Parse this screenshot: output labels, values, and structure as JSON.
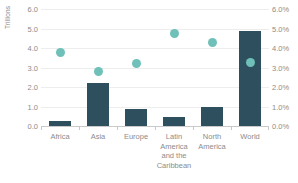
{
  "chart_data": {
    "type": "bar",
    "title": "",
    "subtitle": "",
    "xlabel": "",
    "ylabel": "Trillions",
    "y2label": "",
    "ylim": [
      0,
      6
    ],
    "y2lim": [
      0,
      6
    ],
    "grid": true,
    "legend": "none",
    "categories": [
      "Africa",
      "Asia",
      "Europe",
      "Latin America and the Caribbean",
      "North America",
      "World"
    ],
    "category_lines": [
      [
        "Africa"
      ],
      [
        "Asia"
      ],
      [
        "Europe"
      ],
      [
        "Latin",
        "America",
        "and the",
        "Caribbean"
      ],
      [
        "North",
        "America"
      ],
      [
        "World"
      ]
    ],
    "yticks": [
      "0.0",
      "1.0",
      "2.0",
      "3.0",
      "4.0",
      "5.0",
      "6.0"
    ],
    "ytick_values": [
      0,
      1,
      2,
      3,
      4,
      5,
      6
    ],
    "y2ticks": [
      "0.0%",
      "1.0%",
      "2.0%",
      "3.0%",
      "4.0%",
      "5.0%",
      "6.0%"
    ],
    "y2tick_values": [
      0,
      1,
      2,
      3,
      4,
      5,
      6
    ],
    "series": [
      {
        "name": "Value",
        "type": "bar",
        "axis": "left",
        "unit": "Trillions",
        "color": "#2d4f5e",
        "values": [
          0.25,
          2.2,
          0.85,
          0.45,
          0.95,
          4.85
        ]
      },
      {
        "name": "Share",
        "type": "scatter",
        "axis": "right",
        "unit": "%",
        "color": "#6fc0b8",
        "values": [
          3.8,
          2.85,
          3.25,
          4.8,
          4.35,
          3.3
        ]
      }
    ]
  },
  "colors": {
    "bar": "#2d4f5e",
    "dot": "#6fc0b8",
    "grid": "#ededed",
    "axis": "#c9c9c9",
    "tick_text": "#8c8c8c",
    "background": "#ffffff"
  }
}
